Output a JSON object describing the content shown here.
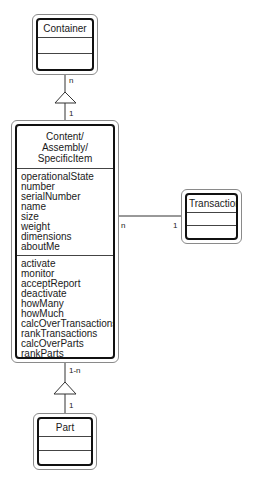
{
  "diagram": {
    "classes": {
      "container": {
        "name": "Container"
      },
      "main": {
        "name_lines": [
          "Content/",
          "Assembly/",
          "SpecificItem"
        ],
        "attributes": [
          "operationalState",
          "number",
          "serialNumber",
          "name",
          "size",
          "weight",
          "dimensions",
          "aboutMe"
        ],
        "operations": [
          "activate",
          "monitor",
          "acceptReport",
          "deactivate",
          "howMany",
          "howMuch",
          "calcOverTransactions",
          "rankTransactions",
          "calcOverParts",
          "rankParts",
          "calcForMe",
          "rateMe"
        ]
      },
      "transaction": {
        "name": "Transaction"
      },
      "part": {
        "name": "Part"
      }
    },
    "relationships": {
      "container_main": {
        "container_end": "n",
        "main_end": "1"
      },
      "main_transaction": {
        "main_end": "n",
        "transaction_end": "1"
      },
      "main_part": {
        "main_end": "1-n",
        "part_end": "1"
      }
    }
  }
}
